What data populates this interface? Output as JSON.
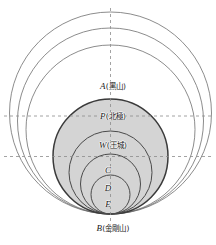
{
  "figure": {
    "title": "",
    "background_color": "#ffffff",
    "shaded_fill": "#d4d4d4",
    "main_stroke": "#3a3a3a",
    "thin_stroke": "#6f6f6f",
    "dash_stroke": "#8c8c8c",
    "labels": [
      {
        "id": "A",
        "point": "A",
        "annotation": "(黑山)",
        "text": "A(黑山)",
        "x": 113,
        "y": 86
      },
      {
        "id": "P",
        "point": "P",
        "annotation": "(北極)",
        "text": "P(北極)",
        "x": 113,
        "y": 116
      },
      {
        "id": "W",
        "point": "W",
        "annotation": "(王城)",
        "text": "W(王城)",
        "x": 113,
        "y": 145
      },
      {
        "id": "C",
        "point": "C",
        "annotation": "",
        "text": "C",
        "x": 108,
        "y": 170
      },
      {
        "id": "D",
        "point": "D",
        "annotation": "",
        "text": "D",
        "x": 108,
        "y": 188
      },
      {
        "id": "E",
        "point": "E",
        "annotation": "",
        "text": "E",
        "x": 108,
        "y": 204
      },
      {
        "id": "B",
        "point": "B",
        "annotation": "(金剛山)",
        "text": "B(金剛山)",
        "x": 113,
        "y": 228
      }
    ],
    "geometry": {
      "axis_x": 110.5,
      "tangent_point_b_y": 214,
      "main_circle": {
        "cx": 110.5,
        "cy": 156.5,
        "r": 57.5
      },
      "outer_circles": [
        {
          "cx": 110.5,
          "cy": 113.0,
          "r": 101.0
        },
        {
          "cx": 110.5,
          "cy": 121.0,
          "r": 93.0
        },
        {
          "cx": 110.5,
          "cy": 129.5,
          "r": 84.5
        }
      ],
      "inner_circles": [
        {
          "cx": 110.5,
          "cy": 172.5,
          "r": 41.5
        },
        {
          "cx": 110.5,
          "cy": 184.0,
          "r": 30.0
        },
        {
          "cx": 110.5,
          "cy": 194.5,
          "r": 19.5
        }
      ],
      "horizontal_dashes": [
        116,
        156.5
      ],
      "vertical_dash": {
        "x": 110.5,
        "y1": 8,
        "y2": 236
      }
    }
  }
}
